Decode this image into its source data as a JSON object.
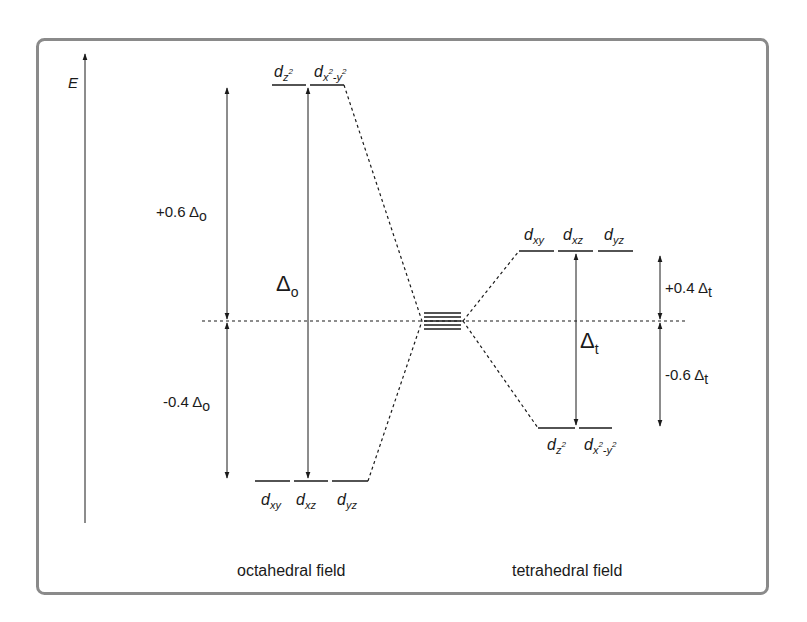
{
  "diagram": {
    "type": "crystal-field-splitting",
    "axis": {
      "label": "E"
    },
    "frame_color": "#8a8a8a",
    "line_color": "#1a1a1a",
    "octahedral": {
      "title": "octahedral field",
      "upper_set": {
        "orbitals": [
          {
            "base": "d",
            "sub": "z",
            "sup": "2",
            "label": "dz²"
          },
          {
            "base": "d",
            "sub": "x",
            "sup": "2",
            "sub2": "-y",
            "sup2": "2",
            "label": "dx²-y²"
          }
        ]
      },
      "lower_set": {
        "orbitals": [
          {
            "base": "d",
            "sub": "xy",
            "label": "dxy"
          },
          {
            "base": "d",
            "sub": "xz",
            "label": "dxz"
          },
          {
            "base": "d",
            "sub": "yz",
            "label": "dyz"
          }
        ]
      },
      "gap": {
        "symbol": "Δ",
        "sub": "o",
        "label": "Δo"
      },
      "upper_shift": {
        "text": "+0.6 Δ",
        "sub": "o",
        "label": "+0.6 Δo"
      },
      "lower_shift": {
        "text": "-0.4 Δ",
        "sub": "o",
        "label": "-0.4 Δo"
      }
    },
    "tetrahedral": {
      "title": "tetrahedral field",
      "upper_set": {
        "orbitals": [
          {
            "base": "d",
            "sub": "xy",
            "label": "dxy"
          },
          {
            "base": "d",
            "sub": "xz",
            "label": "dxz"
          },
          {
            "base": "d",
            "sub": "yz",
            "label": "dyz"
          }
        ]
      },
      "lower_set": {
        "orbitals": [
          {
            "base": "d",
            "sub": "z",
            "sup": "2",
            "label": "dz²"
          },
          {
            "base": "d",
            "sub": "x",
            "sup": "2",
            "sub2": "-y",
            "sup2": "2",
            "label": "dx²-y²"
          }
        ]
      },
      "gap": {
        "symbol": "Δ",
        "sub": "t",
        "label": "Δt"
      },
      "upper_shift": {
        "text": "+0.4 Δ",
        "sub": "t",
        "label": "+0.4 Δt"
      },
      "lower_shift": {
        "text": "-0.6 Δ",
        "sub": "t",
        "label": "-0.6 Δt"
      }
    },
    "free_ion": {
      "degenerate_levels": 5
    }
  }
}
